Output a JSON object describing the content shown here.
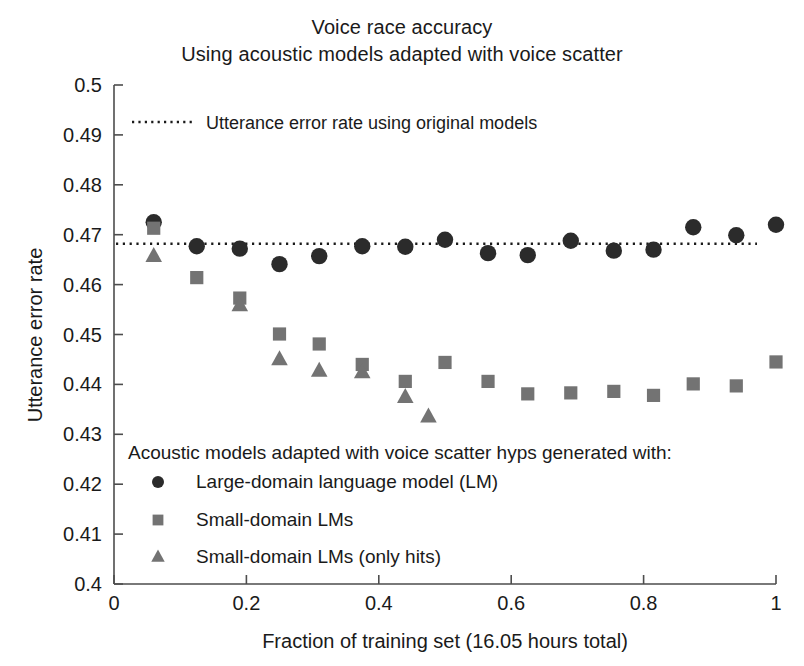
{
  "title": {
    "line1": "Voice race accuracy",
    "line2": "Using acoustic models adapted with voice scatter"
  },
  "annotation": {
    "reference_line_label": "Utterance error rate using original models",
    "reference_line_value": 0.4682,
    "reference_line_style": "dotted"
  },
  "legend": {
    "heading": "Acoustic models adapted with voice scatter hyps generated with:",
    "entries": [
      {
        "marker": "circle",
        "label": "Large-domain language model (LM)",
        "color": "#2b2b2b"
      },
      {
        "marker": "square",
        "label": "Small-domain LMs",
        "color": "#737373"
      },
      {
        "marker": "triangle",
        "label": "Small-domain LMs (only hits)",
        "color": "#737373"
      }
    ]
  },
  "axes": {
    "x_ticks": [
      "0",
      "0.2",
      "0.4",
      "0.6",
      "0.8",
      "1"
    ],
    "x_tick_values": [
      0,
      0.2,
      0.4,
      0.6,
      0.8,
      1
    ],
    "y_ticks": [
      "0.4",
      "0.41",
      "0.42",
      "0.43",
      "0.44",
      "0.45",
      "0.46",
      "0.47",
      "0.48",
      "0.49",
      "0.5"
    ],
    "y_tick_values": [
      0.4,
      0.41,
      0.42,
      0.43,
      0.44,
      0.45,
      0.46,
      0.47,
      0.48,
      0.49,
      0.5
    ]
  },
  "chart_data": {
    "type": "scatter",
    "title": "Voice race accuracy\nUsing acoustic models adapted with voice scatter",
    "xlabel": "Fraction of training set (16.05 hours total)",
    "ylabel": "Utterance error rate",
    "xlim": [
      0,
      1
    ],
    "ylim": [
      0.4,
      0.5
    ],
    "grid": false,
    "legend_position": "inside-lower-left",
    "reference_lines": [
      {
        "y": 0.4682,
        "style": "dotted",
        "label": "Utterance error rate using original models",
        "color": "#1a1a1a"
      }
    ],
    "series": [
      {
        "name": "Large-domain language model (LM)",
        "marker": "circle",
        "color": "#2b2b2b",
        "x": [
          0.06,
          0.125,
          0.19,
          0.25,
          0.31,
          0.375,
          0.44,
          0.5,
          0.565,
          0.625,
          0.69,
          0.755,
          0.815,
          0.875,
          0.94,
          1.0
        ],
        "y": [
          0.4725,
          0.4677,
          0.4672,
          0.4641,
          0.4657,
          0.4677,
          0.4676,
          0.469,
          0.4663,
          0.4659,
          0.4688,
          0.4668,
          0.467,
          0.4715,
          0.4699,
          0.472
        ]
      },
      {
        "name": "Small-domain LMs",
        "marker": "square",
        "color": "#737373",
        "x": [
          0.06,
          0.125,
          0.19,
          0.25,
          0.31,
          0.375,
          0.44,
          0.5,
          0.565,
          0.625,
          0.69,
          0.755,
          0.815,
          0.875,
          0.94,
          1.0
        ],
        "y": [
          0.4713,
          0.4614,
          0.4573,
          0.4501,
          0.4481,
          0.444,
          0.4406,
          0.4444,
          0.4406,
          0.4381,
          0.4383,
          0.4386,
          0.4378,
          0.4401,
          0.4397,
          0.4445
        ]
      },
      {
        "name": "Small-domain LMs (only hits)",
        "marker": "triangle",
        "color": "#737373",
        "x": [
          0.06,
          0.19,
          0.25,
          0.31,
          0.375,
          0.44,
          0.475
        ],
        "y": [
          0.4657,
          0.4558,
          0.445,
          0.4427,
          0.4424,
          0.4374,
          0.4335
        ]
      }
    ]
  }
}
